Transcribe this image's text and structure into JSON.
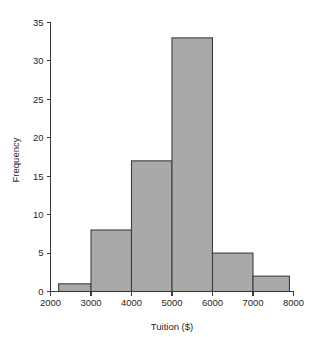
{
  "chart_data": {
    "type": "bar",
    "subtype": "histogram",
    "title": "",
    "xlabel": "Tuition ($)",
    "ylabel": "Frequency",
    "xlim": [
      2000,
      8000
    ],
    "ylim": [
      0,
      35
    ],
    "grid": false,
    "legend": null,
    "bin_width": 1000,
    "xticks": [
      2000,
      3000,
      4000,
      5000,
      6000,
      7000,
      8000
    ],
    "xtick_labels": [
      "2000",
      "3000",
      "4000",
      "5000",
      "6000",
      "7000",
      "8000"
    ],
    "yticks": [
      0,
      5,
      10,
      15,
      20,
      25,
      30,
      35
    ],
    "ytick_labels": [
      "0",
      "5",
      "10",
      "15",
      "20",
      "25",
      "30",
      "35"
    ],
    "bars": [
      {
        "label": "2200-3000",
        "bin_start": 2200,
        "bin_end": 3000,
        "value": 1
      },
      {
        "label": "3000-4000",
        "bin_start": 3000,
        "bin_end": 4000,
        "value": 8
      },
      {
        "label": "4000-5000",
        "bin_start": 4000,
        "bin_end": 5000,
        "value": 17
      },
      {
        "label": "5000-6000",
        "bin_start": 5000,
        "bin_end": 6000,
        "value": 33
      },
      {
        "label": "6000-7000",
        "bin_start": 6000,
        "bin_end": 7000,
        "value": 5
      },
      {
        "label": "7000-7900",
        "bin_start": 7000,
        "bin_end": 7900,
        "value": 2
      }
    ],
    "categories": [
      "2200-3000",
      "3000-4000",
      "4000-5000",
      "5000-6000",
      "6000-7000",
      "7000-7900"
    ],
    "values": [
      1,
      8,
      17,
      33,
      5,
      2
    ],
    "colors": {
      "bar_fill": "#a9a9a9",
      "bar_stroke": "#3f3f3f",
      "axis": "#3a3a3a",
      "text": "#1f1f1f",
      "background": "#ffffff"
    }
  }
}
